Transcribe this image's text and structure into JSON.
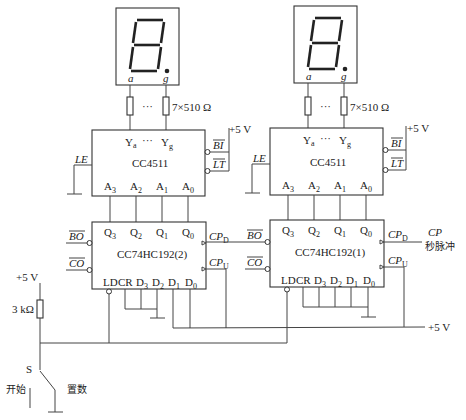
{
  "diagram": {
    "type": "circuit-schematic",
    "title": "",
    "displays": [
      {
        "id": "left",
        "segment_label_a": "a",
        "segment_label_g": "g"
      },
      {
        "id": "right",
        "segment_label_a": "a",
        "segment_label_g": "g"
      }
    ],
    "resistor_array_label": "7×510 Ω",
    "ellipsis": "···",
    "decoder": {
      "name": "CC4511",
      "outputs": {
        "ya": "Y",
        "ya_sub": "a",
        "yg": "Y",
        "yg_sub": "g"
      },
      "inputs": [
        "A",
        "A",
        "A",
        "A"
      ],
      "input_subs": [
        "3",
        "2",
        "1",
        "0"
      ],
      "pin_le": "LE",
      "pin_bi": "BI",
      "pin_lt": "LT",
      "supply": "+5 V"
    },
    "counter_left": {
      "name": "CC74HC192(2)"
    },
    "counter_right": {
      "name": "CC74HC192(1)"
    },
    "counter_pins": {
      "q": "Q",
      "q_subs": [
        "3",
        "2",
        "1",
        "0"
      ],
      "cpd": "CP",
      "cpd_sub": "D",
      "cpu": "CP",
      "cpu_sub": "U",
      "bo": "BO",
      "co": "CO",
      "ld": "LD",
      "cr": "CR",
      "d": "D",
      "d_subs": [
        "3",
        "2",
        "1",
        "0"
      ]
    },
    "clock_input": {
      "label": "CP",
      "desc": "秒脉冲"
    },
    "supply_right": "+5 V",
    "pullup": {
      "supply": "+5 V",
      "resistor": "3 kΩ"
    },
    "switch": {
      "label": "S",
      "pos_start": "开始",
      "pos_preset": "置数"
    }
  }
}
